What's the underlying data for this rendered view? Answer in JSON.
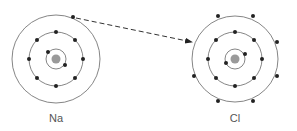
{
  "diagram": {
    "type": "electron-transfer",
    "atoms": [
      {
        "symbol": "Na",
        "shells": [
          2,
          8,
          1
        ]
      },
      {
        "symbol": "Cl",
        "shells": [
          2,
          8,
          7
        ]
      }
    ],
    "arrow": {
      "from": "Na outer electron",
      "to": "Cl outer shell",
      "style": "dashed"
    },
    "colors": {
      "line": "#555555",
      "electron": "#222222",
      "nucleus": "#9a9a9a"
    }
  }
}
